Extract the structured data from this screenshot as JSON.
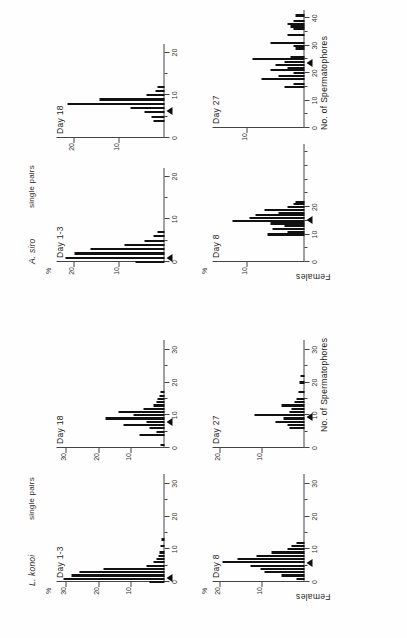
{
  "figure": {
    "orientation_note": "rotated",
    "x_axis_title": "No. of Spermatophores",
    "y_axis_title": "Females",
    "percent_symbol": "%",
    "groups": [
      {
        "species": "L. konoi",
        "subtitle": "single pairs"
      },
      {
        "species": "A. siro",
        "subtitle": "single pairs"
      }
    ]
  },
  "chart_data": [
    {
      "type": "bar",
      "id": "konoi-day1-3",
      "title": "Day 1-3",
      "group": "L. konoi",
      "xlabel": "No. of Spermatophores",
      "ylabel": "Females",
      "xlim": [
        0,
        33
      ],
      "ylim": [
        0,
        33
      ],
      "xticks": [
        0,
        10,
        20,
        30
      ],
      "xticklabels": [
        "0",
        "10",
        "20",
        "30"
      ],
      "yticks": [
        10,
        20,
        30
      ],
      "yticklabels": [
        "10",
        "20",
        "30"
      ],
      "marker_x": 1.5,
      "x": [
        0,
        1,
        2,
        3,
        4,
        5,
        6,
        7,
        8,
        9,
        11,
        13
      ],
      "values": [
        4.5,
        31.0,
        28.5,
        26.0,
        18.5,
        5.5,
        3.5,
        2.5,
        1.8,
        1.5,
        1.2,
        1.0
      ]
    },
    {
      "type": "bar",
      "id": "konoi-day18",
      "title": "Day 18",
      "group": "L. konoi",
      "xlabel": "No. of Spermatophores",
      "ylabel": "Females",
      "xlim": [
        0,
        33
      ],
      "ylim": [
        0,
        33
      ],
      "xticks": [
        0,
        10,
        20,
        30
      ],
      "xticklabels": [
        "0",
        "10",
        "20",
        "30"
      ],
      "yticks": [
        10,
        20,
        30
      ],
      "yticklabels": [
        "10",
        "20",
        "30"
      ],
      "marker_x": 8.0,
      "x": [
        1,
        4,
        5,
        6,
        7,
        8,
        9,
        10,
        11,
        12,
        13,
        14,
        15,
        16,
        17
      ],
      "values": [
        1.2,
        7.5,
        2.5,
        4.5,
        12.5,
        5.5,
        18.0,
        9.5,
        14.0,
        6.5,
        3.5,
        2.5,
        2.0,
        1.5,
        1.2
      ]
    },
    {
      "type": "bar",
      "id": "konoi-day8",
      "title": "Day 8",
      "group": "L. konoi",
      "xlabel": "No. of Spermatophores",
      "ylabel": "Females",
      "xlim": [
        0,
        33
      ],
      "ylim": [
        0,
        22
      ],
      "xticks": [
        0,
        10,
        20,
        30
      ],
      "xticklabels": [
        "0",
        "10",
        "20",
        "30"
      ],
      "yticks": [
        10,
        20
      ],
      "yticklabels": [
        "10",
        "20"
      ],
      "marker_x": 6.0,
      "x": [
        1,
        2,
        3,
        4,
        5,
        6,
        7,
        8,
        9,
        10,
        11,
        12
      ],
      "values": [
        2.0,
        5.5,
        9.5,
        10.5,
        13.0,
        19.5,
        16.0,
        11.5,
        8.0,
        4.0,
        3.0,
        2.0
      ]
    },
    {
      "type": "bar",
      "id": "konoi-day27",
      "title": "Day 27",
      "group": "L. konoi",
      "xlabel": "No. of Spermatophores",
      "ylabel": "Females",
      "xlim": [
        0,
        33
      ],
      "ylim": [
        0,
        22
      ],
      "xticks": [
        0,
        10,
        20,
        30
      ],
      "xticklabels": [
        "0",
        "10",
        "20",
        "30"
      ],
      "yticks": [
        10,
        20
      ],
      "yticklabels": [
        "10",
        "20"
      ],
      "marker_x": 9.5,
      "x": [
        6,
        7,
        8,
        9,
        10,
        11,
        12,
        13,
        14,
        15,
        17,
        20,
        22
      ],
      "values": [
        3.5,
        4.0,
        7.0,
        5.0,
        12.0,
        3.5,
        3.0,
        5.5,
        2.5,
        2.0,
        1.5,
        1.2,
        1.0
      ]
    },
    {
      "type": "bar",
      "id": "siro-day1-3",
      "title": "Day 1-3",
      "group": "A. siro",
      "xlabel": "No. of Spermatophores",
      "ylabel": "Females",
      "xlim": [
        0,
        22
      ],
      "ylim": [
        0,
        24
      ],
      "xticks": [
        0,
        10,
        20
      ],
      "xticklabels": [
        "0",
        "10",
        "20"
      ],
      "yticks": [
        10,
        20
      ],
      "yticklabels": [
        "10",
        "20"
      ],
      "marker_x": 1.0,
      "x": [
        0,
        1,
        2,
        3,
        4,
        5,
        6,
        7
      ],
      "values": [
        6.5,
        22.0,
        20.0,
        16.5,
        9.0,
        4.5,
        2.5,
        1.5
      ]
    },
    {
      "type": "bar",
      "id": "siro-day18",
      "title": "Day 18",
      "group": "A. siro",
      "xlabel": "No. of Spermatophores",
      "ylabel": "Females",
      "xlim": [
        0,
        22
      ],
      "ylim": [
        0,
        24
      ],
      "xticks": [
        0,
        10,
        20
      ],
      "xticklabels": [
        "0",
        "10",
        "20"
      ],
      "yticks": [
        10,
        20
      ],
      "yticklabels": [
        "10",
        "20"
      ],
      "marker_x": 6.5,
      "x": [
        4,
        5,
        6,
        7,
        8,
        9,
        10,
        11,
        12
      ],
      "values": [
        2.5,
        3.0,
        4.5,
        7.5,
        21.5,
        14.5,
        4.0,
        2.0,
        1.5
      ]
    },
    {
      "type": "bar",
      "id": "siro-day8",
      "title": "Day 8",
      "group": "A. siro",
      "xlabel": "No. of Spermatophores",
      "ylabel": "Females",
      "xlim": [
        0,
        43
      ],
      "ylim": [
        0,
        16
      ],
      "xticks": [
        0,
        10,
        20
      ],
      "xticklabels": [
        "0",
        "10",
        "20"
      ],
      "yticks": [
        10
      ],
      "yticklabels": [
        "10"
      ],
      "marker_x": 15.5,
      "x": [
        10,
        11,
        12,
        13,
        14,
        15,
        16,
        17,
        18,
        19,
        20,
        21,
        22
      ],
      "values": [
        6.5,
        3.0,
        5.5,
        3.5,
        6.0,
        12.5,
        9.5,
        8.5,
        4.5,
        7.0,
        3.0,
        2.0,
        1.5
      ]
    },
    {
      "type": "bar",
      "id": "siro-day27",
      "title": "Day 27",
      "group": "A. siro",
      "xlabel": "No. of Spermatophores",
      "ylabel": "Females",
      "xlim": [
        0,
        43
      ],
      "ylim": [
        0,
        16
      ],
      "xticks": [
        0,
        10,
        20,
        30,
        40
      ],
      "xticklabels": [
        "0",
        "10",
        "20",
        "30",
        "40"
      ],
      "yticks": [
        10
      ],
      "yticklabels": [
        "10"
      ],
      "marker_x": 24.0,
      "x": [
        15,
        16,
        18,
        19,
        20,
        21,
        22,
        23,
        24,
        25,
        26,
        29,
        30,
        31,
        34,
        36,
        37,
        38,
        39,
        41
      ],
      "values": [
        3.5,
        2.0,
        7.5,
        4.5,
        2.0,
        6.0,
        3.0,
        5.0,
        3.5,
        9.0,
        2.5,
        1.5,
        2.0,
        6.0,
        3.0,
        2.0,
        2.5,
        3.0,
        2.0,
        1.5
      ]
    }
  ]
}
